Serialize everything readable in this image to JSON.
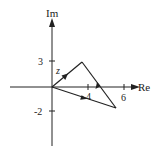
{
  "diagram": {
    "type": "complex-plane",
    "axes": {
      "x_label": "Re",
      "y_label": "Im",
      "x_ticks": [
        {
          "label": "4",
          "value": 4
        },
        {
          "label": "6",
          "value": 6
        }
      ],
      "y_ticks": [
        {
          "label": "3",
          "value": 3
        },
        {
          "label": "-2",
          "value": -2
        }
      ]
    },
    "vectors": [
      {
        "name": "z",
        "from": [
          0,
          0
        ],
        "to": [
          3,
          3
        ],
        "label": "z"
      },
      {
        "name": "side",
        "from": [
          6,
          -2
        ],
        "to": [
          3,
          3
        ],
        "label": ""
      },
      {
        "name": "sum",
        "from": [
          0,
          0
        ],
        "to": [
          6,
          -2
        ],
        "label": ""
      }
    ],
    "colors": {
      "line": "#222222",
      "background": "#ffffff"
    }
  }
}
